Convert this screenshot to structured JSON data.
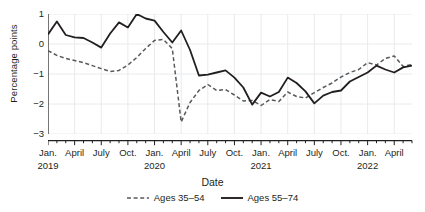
{
  "chart_data": {
    "type": "line",
    "title": "",
    "xlabel": "Date",
    "ylabel": "Percentage points",
    "ylim": [
      -3,
      1
    ],
    "yticks": [
      1,
      0,
      -1,
      -2,
      -3
    ],
    "ytick_labels": [
      "1",
      "0",
      "−1",
      "−2",
      "−3"
    ],
    "grid": true,
    "legend_position": "bottom",
    "x": [
      "Jan. 2019",
      "Feb. 2019",
      "Mar. 2019",
      "April 2019",
      "May 2019",
      "June 2019",
      "July 2019",
      "Aug. 2019",
      "Sept. 2019",
      "Oct. 2019",
      "Nov. 2019",
      "Dec. 2019",
      "Jan. 2020",
      "Feb. 2020",
      "Mar. 2020",
      "April 2020",
      "May 2020",
      "June 2020",
      "July 2020",
      "Aug. 2020",
      "Sept. 2020",
      "Oct. 2020",
      "Nov. 2020",
      "Dec. 2020",
      "Jan. 2021",
      "Feb. 2021",
      "Mar. 2021",
      "April 2021",
      "May 2021",
      "June 2021",
      "July 2021",
      "Aug. 2021",
      "Sept. 2021",
      "Oct. 2021",
      "Nov. 2021",
      "Dec. 2021",
      "Jan. 2022",
      "Feb. 2022",
      "Mar. 2022",
      "April 2022",
      "May 2022",
      "June 2022"
    ],
    "xtick_labels": [
      {
        "label": "Jan.",
        "year": "2019",
        "index": 0
      },
      {
        "label": "April",
        "year": "",
        "index": 3
      },
      {
        "label": "July",
        "year": "",
        "index": 6
      },
      {
        "label": "Oct.",
        "year": "",
        "index": 9
      },
      {
        "label": "Jan.",
        "year": "2020",
        "index": 12
      },
      {
        "label": "April",
        "year": "",
        "index": 15
      },
      {
        "label": "July",
        "year": "",
        "index": 18
      },
      {
        "label": "Oct.",
        "year": "",
        "index": 21
      },
      {
        "label": "Jan.",
        "year": "2021",
        "index": 24
      },
      {
        "label": "April",
        "year": "",
        "index": 27
      },
      {
        "label": "July",
        "year": "",
        "index": 30
      },
      {
        "label": "Oct.",
        "year": "",
        "index": 33
      },
      {
        "label": "Jan.",
        "year": "2022",
        "index": 36
      },
      {
        "label": "April",
        "year": "",
        "index": 39
      }
    ],
    "series": [
      {
        "name": "Ages 35–54",
        "style": "dashed",
        "color": "#58595b",
        "values": [
          -0.22,
          -0.38,
          -0.48,
          -0.55,
          -0.62,
          -0.72,
          -0.82,
          -0.92,
          -0.88,
          -0.7,
          -0.45,
          -0.15,
          0.12,
          0.15,
          -0.15,
          -2.6,
          -1.95,
          -1.55,
          -1.35,
          -1.55,
          -1.52,
          -1.7,
          -1.9,
          -1.88,
          -2.05,
          -1.85,
          -1.92,
          -1.6,
          -1.75,
          -1.8,
          -1.62,
          -1.45,
          -1.3,
          -1.1,
          -0.95,
          -0.85,
          -0.62,
          -0.7,
          -0.48,
          -0.4,
          -0.75,
          -0.68
        ]
      },
      {
        "name": "Ages 55–74",
        "style": "solid",
        "color": "#231f20",
        "values": [
          0.32,
          0.75,
          0.3,
          0.22,
          0.2,
          0.05,
          -0.12,
          0.35,
          0.72,
          0.55,
          1.0,
          0.85,
          0.78,
          0.4,
          0.05,
          0.45,
          -0.2,
          -1.05,
          -1.02,
          -0.95,
          -0.88,
          -1.12,
          -1.45,
          -2.02,
          -1.62,
          -1.75,
          -1.6,
          -1.12,
          -1.3,
          -1.58,
          -1.98,
          -1.72,
          -1.6,
          -1.55,
          -1.25,
          -1.1,
          -0.95,
          -0.72,
          -0.85,
          -0.95,
          -0.78,
          -0.72
        ]
      }
    ]
  },
  "axis": {
    "y_label": "Percentage points",
    "x_label": "Date"
  },
  "legend": {
    "items": [
      {
        "label": "Ages 35–54",
        "style": "dashed"
      },
      {
        "label": "Ages 55–74",
        "style": "solid"
      }
    ]
  }
}
